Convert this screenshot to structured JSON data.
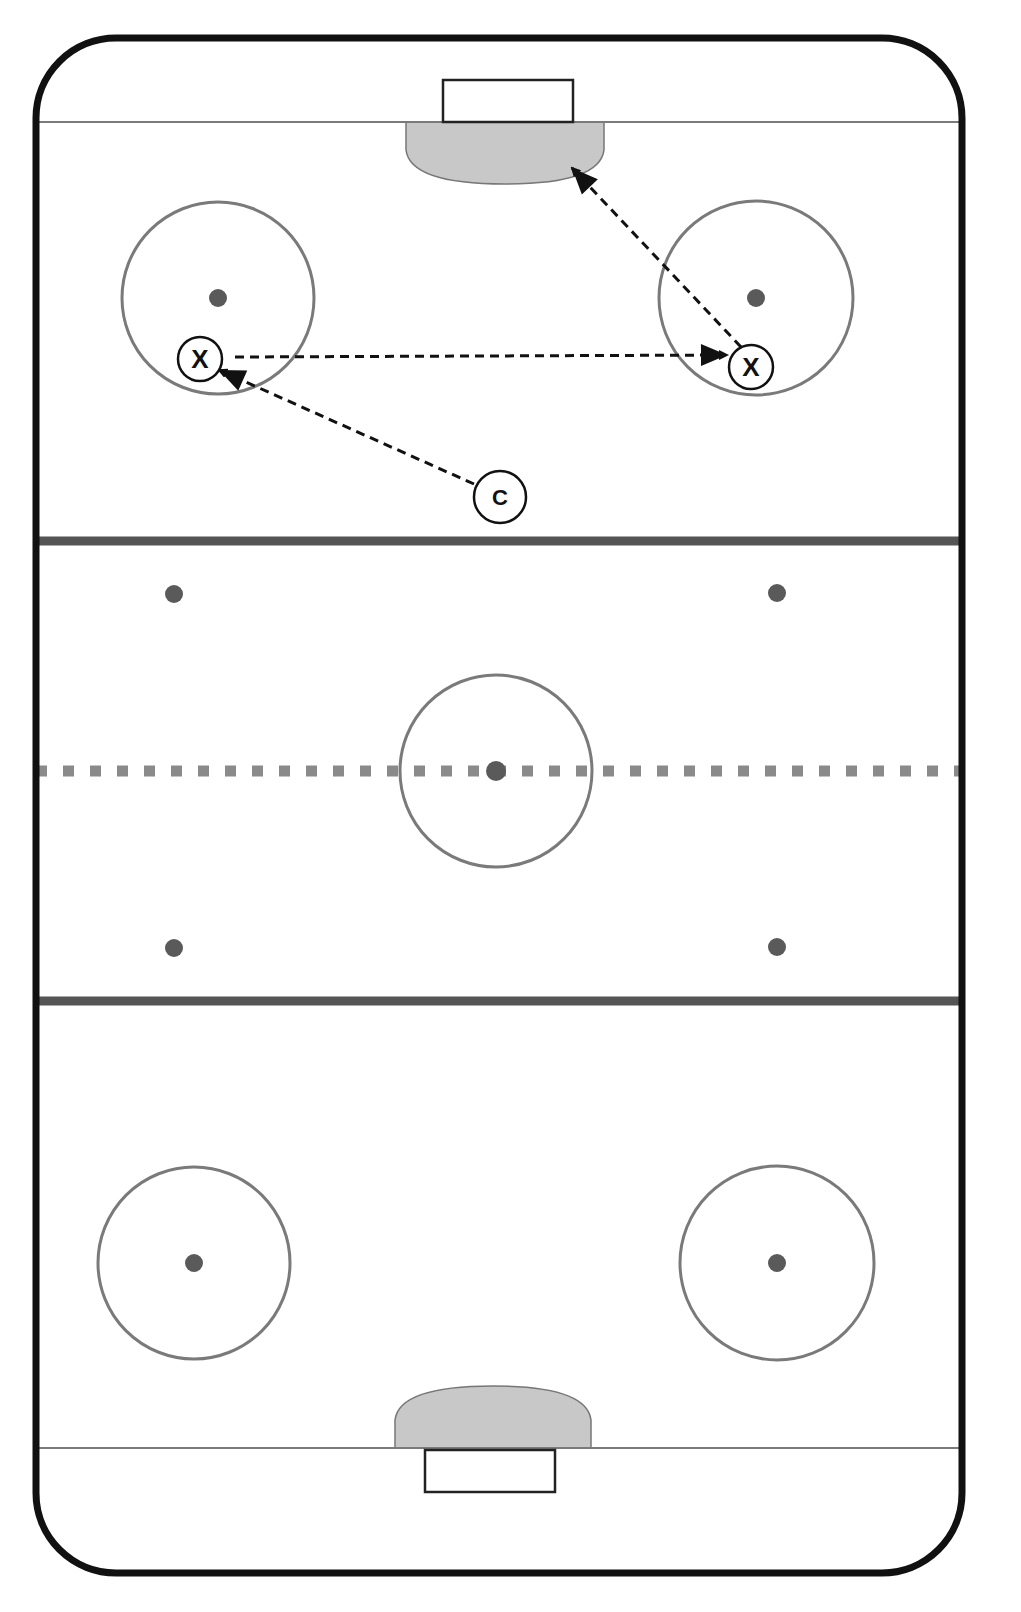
{
  "diagram": {
    "type": "hockey-drill",
    "colors": {
      "boards": "#111111",
      "line_gray": "#7a7a7a",
      "blue_line": "#555555",
      "red_line": "#8a8a8a",
      "crease": "#c8c8c8",
      "circle": "#7a7a7a",
      "dot": "#5a5a5a",
      "arrow": "#111111",
      "player_stroke": "#111111"
    },
    "rink": {
      "x": 36,
      "y": 38,
      "width": 926,
      "height": 1535,
      "corner_radius": 80
    },
    "goal_lines": [
      {
        "y": 122
      },
      {
        "y": 1448
      }
    ],
    "blue_lines": [
      {
        "y": 541
      },
      {
        "y": 1001
      }
    ],
    "red_line": {
      "y": 771
    },
    "nets": [
      {
        "x": 443,
        "y": 80,
        "width": 130,
        "height": 42
      },
      {
        "x": 425,
        "y": 1450,
        "width": 130,
        "height": 42
      }
    ],
    "creases": [
      {
        "position": "top",
        "x": 406,
        "y": 122,
        "width": 198,
        "depth": 62
      },
      {
        "position": "bottom",
        "x": 395,
        "y": 1448,
        "width": 196,
        "depth": 62
      }
    ],
    "center_circle": {
      "cx": 496,
      "cy": 771,
      "r": 96
    },
    "faceoff_circles": [
      {
        "cx": 218,
        "cy": 298,
        "r": 96
      },
      {
        "cx": 756,
        "cy": 298,
        "r": 97
      },
      {
        "cx": 194,
        "cy": 1263,
        "r": 96
      },
      {
        "cx": 777,
        "cy": 1263,
        "r": 97
      }
    ],
    "dots": [
      {
        "cx": 218,
        "cy": 298
      },
      {
        "cx": 756,
        "cy": 298
      },
      {
        "cx": 174,
        "cy": 594
      },
      {
        "cx": 777,
        "cy": 593
      },
      {
        "cx": 496,
        "cy": 771
      },
      {
        "cx": 174,
        "cy": 948
      },
      {
        "cx": 777,
        "cy": 947
      },
      {
        "cx": 194,
        "cy": 1263
      },
      {
        "cx": 777,
        "cy": 1263
      }
    ],
    "players": [
      {
        "id": "x1",
        "label": "X",
        "cx": 200,
        "cy": 359,
        "r": 22
      },
      {
        "id": "x2",
        "label": "X",
        "cx": 751,
        "cy": 367,
        "r": 22
      },
      {
        "id": "c",
        "label": "C",
        "cx": 500,
        "cy": 497,
        "r": 26
      }
    ],
    "arrows": [
      {
        "from": [
          474,
          484
        ],
        "to": [
          219,
          370
        ],
        "description": "coach passes to left X"
      },
      {
        "from": [
          235,
          357
        ],
        "to": [
          727,
          355
        ],
        "description": "left X passes to right X"
      },
      {
        "from": [
          741,
          347
        ],
        "to": [
          572,
          168
        ],
        "description": "right X shoots on net"
      }
    ]
  }
}
